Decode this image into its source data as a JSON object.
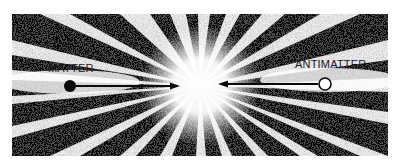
{
  "figure": {
    "labels": {
      "matter": "MATTER",
      "antimatter": "ANTIMATTER"
    },
    "colors": {
      "background": "#ffffff",
      "ink": "#0a0a0a",
      "burst": "#ffffff"
    },
    "elements": {
      "matter_particle": "filled-circle",
      "antimatter_particle": "hollow-circle",
      "arrows": "converging-to-center",
      "burst": "radiating-starburst"
    }
  }
}
